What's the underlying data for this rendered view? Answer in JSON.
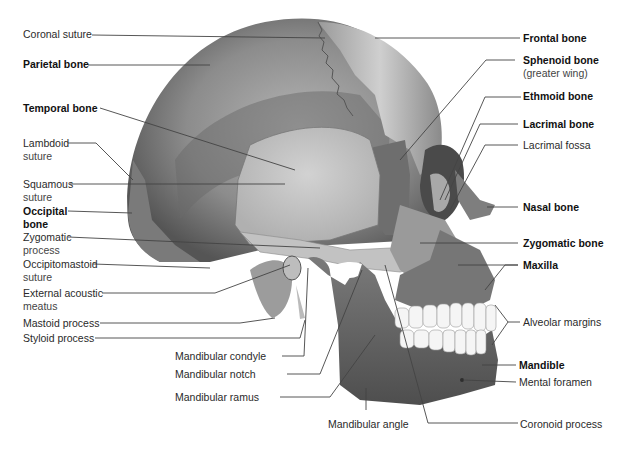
{
  "figure": {
    "colors": {
      "background": "#ffffff",
      "text": "#222222",
      "leader_line": "#444444",
      "parietal": "#8a8a8a",
      "temporal": "#c9c9c9",
      "frontal": "#bdbdbd",
      "sphenoid": "#6e6e6e",
      "occipital": "#7a7a7a",
      "maxilla": "#767676",
      "mandible": "#6a6a6a",
      "teeth": "#f4f4f4"
    }
  },
  "labels_left": [
    {
      "id": "coronal-suture",
      "text": "Coronal suture",
      "bold": false
    },
    {
      "id": "parietal-bone",
      "text": "Parietal bone",
      "bold": true
    },
    {
      "id": "temporal-bone",
      "text": "Temporal bone",
      "bold": true
    },
    {
      "id": "lambdoid-suture",
      "text": "Lambdoid",
      "text2": "suture",
      "bold": false
    },
    {
      "id": "squamous-suture",
      "text": "Squamous",
      "text2": "suture",
      "bold": false
    },
    {
      "id": "occipital-bone",
      "text": "Occipital",
      "text2": "bone",
      "bold": true
    },
    {
      "id": "zygomatic-process",
      "text": "Zygomatic",
      "text2": "process",
      "bold": false
    },
    {
      "id": "occipitomastoid-suture",
      "text": "Occipitomastoid",
      "text2": "suture",
      "bold": false
    },
    {
      "id": "external-acoustic-meatus",
      "text": "External acoustic",
      "text2": "meatus",
      "bold": false
    },
    {
      "id": "mastoid-process",
      "text": "Mastoid process",
      "bold": false
    },
    {
      "id": "styloid-process",
      "text": "Styloid process",
      "bold": false
    }
  ],
  "labels_right": [
    {
      "id": "frontal-bone",
      "text": "Frontal bone",
      "bold": true
    },
    {
      "id": "sphenoid-bone",
      "text": "Sphenoid bone",
      "text2": "(greater wing)",
      "bold": true
    },
    {
      "id": "ethmoid-bone",
      "text": "Ethmoid bone",
      "bold": true
    },
    {
      "id": "lacrimal-bone",
      "text": "Lacrimal bone",
      "bold": true
    },
    {
      "id": "lacrimal-fossa",
      "text": "Lacrimal fossa",
      "bold": false
    },
    {
      "id": "nasal-bone",
      "text": "Nasal bone",
      "bold": true
    },
    {
      "id": "zygomatic-bone",
      "text": "Zygomatic bone",
      "bold": true
    },
    {
      "id": "maxilla",
      "text": "Maxilla",
      "bold": true
    },
    {
      "id": "alveolar-margins",
      "text": "Alveolar margins",
      "bold": false
    },
    {
      "id": "mandible",
      "text": "Mandible",
      "bold": true
    },
    {
      "id": "mental-foramen",
      "text": "Mental foramen",
      "bold": false
    },
    {
      "id": "coronoid-process",
      "text": "Coronoid process",
      "bold": false
    }
  ],
  "labels_bottom": [
    {
      "id": "mandibular-condyle",
      "text": "Mandibular condyle",
      "bold": false
    },
    {
      "id": "mandibular-notch",
      "text": "Mandibular notch",
      "bold": false
    },
    {
      "id": "mandibular-ramus",
      "text": "Mandibular ramus",
      "bold": false
    },
    {
      "id": "mandibular-angle",
      "text": "Mandibular angle",
      "bold": false
    }
  ]
}
